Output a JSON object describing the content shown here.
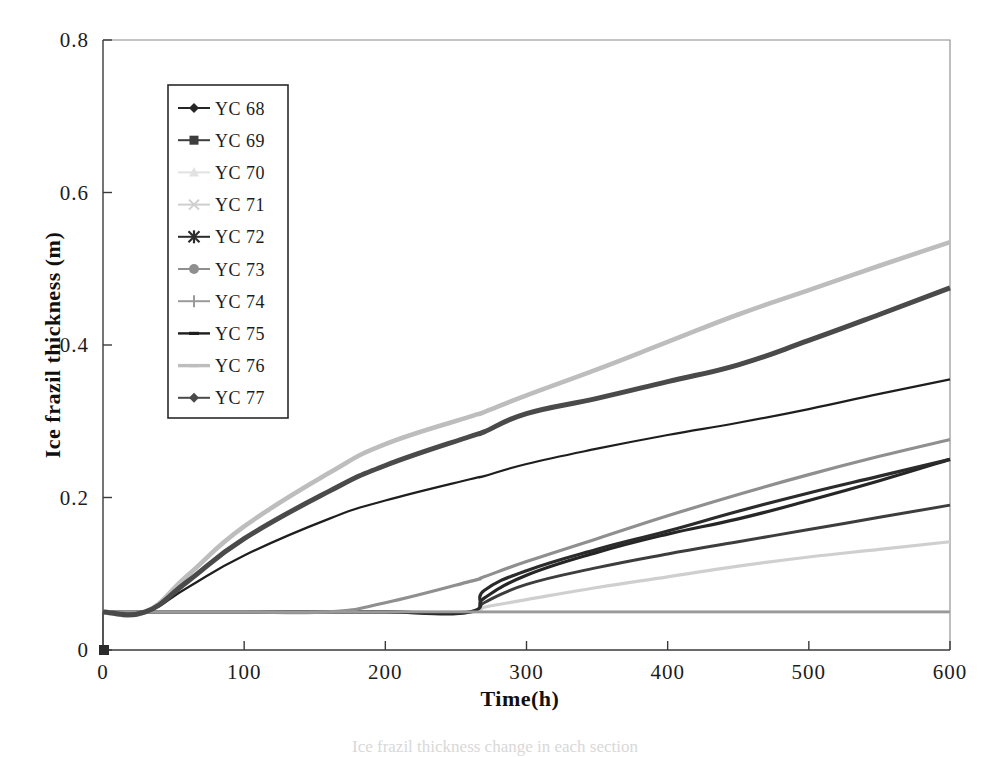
{
  "chart_data": {
    "type": "line",
    "title": "",
    "xlabel": "Time(h)",
    "ylabel": "Ice frazil thickness (m)",
    "xlim": [
      0,
      600
    ],
    "ylim": [
      0,
      0.8
    ],
    "xticks": [
      "0",
      "100",
      "200",
      "300",
      "400",
      "500",
      "600"
    ],
    "yticks": [
      "0",
      "0.2",
      "0.4",
      "0.6",
      "0.8"
    ],
    "grid": false,
    "legend_position": "upper-left-inside",
    "x": [
      0,
      30,
      60,
      100,
      160,
      200,
      260,
      270,
      300,
      350,
      400,
      450,
      500,
      550,
      600
    ],
    "series": [
      {
        "name": "YC 68",
        "marker": "diamond",
        "color": "#262626",
        "width": 3.2,
        "values": [
          0.05,
          0.05,
          0.05,
          0.05,
          0.05,
          0.05,
          0.05,
          0.068,
          0.098,
          0.128,
          0.152,
          0.172,
          0.196,
          0.222,
          0.25
        ]
      },
      {
        "name": "YC 69",
        "marker": "square",
        "color": "#3d3d3d",
        "width": 3.0,
        "values": [
          0.05,
          0.05,
          0.05,
          0.05,
          0.05,
          0.05,
          0.05,
          0.062,
          0.086,
          0.108,
          0.126,
          0.142,
          0.158,
          0.174,
          0.19
        ]
      },
      {
        "name": "YC 70",
        "marker": "triangle",
        "color": "#e2e2e2",
        "width": 3.0,
        "values": [
          0.05,
          0.05,
          0.05,
          0.05,
          0.05,
          0.05,
          0.05,
          0.05,
          0.05,
          0.05,
          0.05,
          0.05,
          0.05,
          0.05,
          0.05
        ]
      },
      {
        "name": "YC 71",
        "marker": "cross",
        "color": "#cfcfcf",
        "width": 3.2,
        "values": [
          0.05,
          0.05,
          0.05,
          0.05,
          0.05,
          0.05,
          0.05,
          0.056,
          0.066,
          0.082,
          0.096,
          0.11,
          0.122,
          0.132,
          0.142
        ]
      },
      {
        "name": "YC 72",
        "marker": "asterisk",
        "color": "#2b2b2b",
        "width": 3.2,
        "values": [
          0.05,
          0.05,
          0.05,
          0.05,
          0.05,
          0.05,
          0.05,
          0.078,
          0.104,
          0.132,
          0.156,
          0.182,
          0.206,
          0.228,
          0.25
        ]
      },
      {
        "name": "YC 73",
        "marker": "circle",
        "color": "#8f8f8f",
        "width": 3.2,
        "values": [
          0.05,
          0.05,
          0.05,
          0.05,
          0.05,
          0.062,
          0.09,
          0.096,
          0.116,
          0.146,
          0.176,
          0.204,
          0.23,
          0.254,
          0.276
        ]
      },
      {
        "name": "YC 74",
        "marker": "plus",
        "color": "#9a9a9a",
        "width": 2.6,
        "values": [
          0.05,
          0.05,
          0.05,
          0.05,
          0.05,
          0.05,
          0.05,
          0.05,
          0.05,
          0.05,
          0.05,
          0.05,
          0.05,
          0.05,
          0.05
        ]
      },
      {
        "name": "YC 75",
        "marker": "dash",
        "color": "#1e1e1e",
        "width": 2.2,
        "values": [
          0.05,
          0.05,
          0.082,
          0.124,
          0.172,
          0.196,
          0.224,
          0.228,
          0.244,
          0.264,
          0.282,
          0.298,
          0.316,
          0.336,
          0.355
        ]
      },
      {
        "name": "YC 76",
        "marker": "dash-light",
        "color": "#bdbdbd",
        "width": 4.6,
        "values": [
          0.05,
          0.05,
          0.098,
          0.162,
          0.232,
          0.27,
          0.306,
          0.312,
          0.334,
          0.368,
          0.404,
          0.44,
          0.472,
          0.504,
          0.535
        ]
      },
      {
        "name": "YC 77",
        "marker": "diamond",
        "color": "#4a4a4a",
        "width": 5.0,
        "values": [
          0.05,
          0.05,
          0.09,
          0.146,
          0.208,
          0.242,
          0.28,
          0.286,
          0.31,
          0.33,
          0.352,
          0.374,
          0.406,
          0.44,
          0.475
        ]
      }
    ]
  },
  "axes": {
    "y_title": "Ice frazil thickness (m)",
    "x_title": "Time(h)",
    "y_tick_labels": [
      "0.8",
      "0.6",
      "0.4",
      "0.2",
      "0"
    ],
    "x_tick_labels": [
      "0",
      "100",
      "200",
      "300",
      "400",
      "500",
      "600"
    ]
  },
  "legend": {
    "items": [
      {
        "label": "YC 68",
        "marker": "diamond",
        "color": "#262626"
      },
      {
        "label": "YC 69",
        "marker": "square",
        "color": "#3d3d3d"
      },
      {
        "label": "YC 70",
        "marker": "triangle",
        "color": "#e2e2e2"
      },
      {
        "label": "YC 71",
        "marker": "cross",
        "color": "#cfcfcf"
      },
      {
        "label": "YC 72",
        "marker": "asterisk",
        "color": "#2b2b2b"
      },
      {
        "label": "YC 73",
        "marker": "circle",
        "color": "#8f8f8f"
      },
      {
        "label": "YC 74",
        "marker": "plus",
        "color": "#9a9a9a"
      },
      {
        "label": "YC 75",
        "marker": "dash",
        "color": "#1e1e1e"
      },
      {
        "label": "YC 76",
        "marker": "dash-light",
        "color": "#bdbdbd"
      },
      {
        "label": "YC 77",
        "marker": "diamond",
        "color": "#4a4a4a"
      }
    ]
  },
  "caption": {
    "text": "Ice frazil thickness change in each section"
  }
}
